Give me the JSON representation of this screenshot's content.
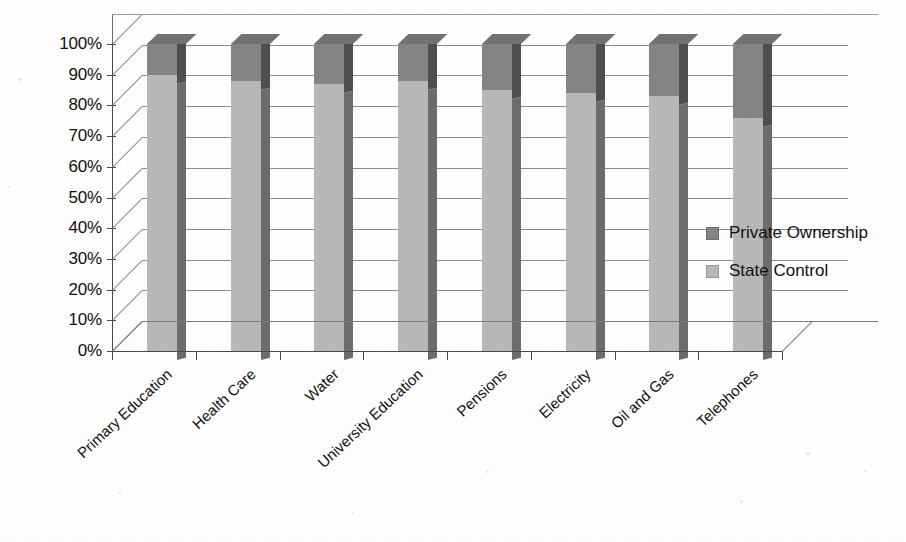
{
  "chart_data": {
    "type": "bar",
    "subtype": "100% stacked column (3D)",
    "title": "",
    "subtitle": "",
    "xlabel": "",
    "ylabel": "",
    "ylim": [
      0,
      100
    ],
    "yunit": "%",
    "grid": true,
    "legend_position": "right",
    "categories": [
      "Primary Education",
      "Health Care",
      "Water",
      "University Education",
      "Pensions",
      "Electricity",
      "Oil and Gas",
      "Telephones"
    ],
    "ytick_labels": [
      "100%",
      "90%",
      "80%",
      "70%",
      "60%",
      "50%",
      "40%",
      "30%",
      "20%",
      "10%",
      "0%"
    ],
    "ytick_values": [
      100,
      90,
      80,
      70,
      60,
      50,
      40,
      30,
      20,
      10,
      0
    ],
    "series": [
      {
        "name": "Private Ownership",
        "color": "#858585",
        "values": [
          10,
          12,
          13,
          12,
          15,
          16,
          17,
          24
        ]
      },
      {
        "name": "State Control",
        "color": "#b9b9b9",
        "values": [
          90,
          88,
          87,
          88,
          85,
          84,
          83,
          76
        ]
      }
    ],
    "stack_order_bottom_to_top": [
      "State Control",
      "Private Ownership"
    ]
  },
  "legend": {
    "items": [
      {
        "label": "Private Ownership",
        "color": "#858585"
      },
      {
        "label": "State Control",
        "color": "#b9b9b9"
      }
    ]
  },
  "colors": {
    "private_ownership": "#858585",
    "state_control": "#b9b9b9",
    "gridline": "#8d8d8d",
    "axis": "#4a4a4a",
    "background": "#ffffff"
  }
}
